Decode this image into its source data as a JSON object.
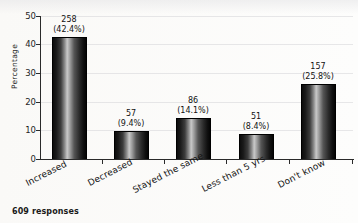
{
  "chart_data": {
    "type": "bar",
    "title": "",
    "title_note": "title cropped off at top edge, illegible",
    "xlabel": "",
    "ylabel": "Percentage",
    "ylim": [
      0,
      50
    ],
    "yticks": [
      0,
      10,
      20,
      30,
      40,
      50
    ],
    "grid": true,
    "legend": "none",
    "categories": [
      "Increased",
      "Decreased",
      "Stayed the same",
      "Less than 5 yrs",
      "Don't know"
    ],
    "values": [
      42.4,
      9.4,
      14.1,
      8.4,
      25.8
    ],
    "counts": [
      258,
      57,
      86,
      51,
      157
    ],
    "data_labels": [
      {
        "count": "258",
        "pct": "(42.4%)"
      },
      {
        "count": "57",
        "pct": "(9.4%)"
      },
      {
        "count": "86",
        "pct": "(14.1%)"
      },
      {
        "count": "51",
        "pct": "(8.4%)"
      },
      {
        "count": "157",
        "pct": "(25.8%)"
      }
    ],
    "footnote": "609 responses"
  },
  "axis": {
    "y_title": "Percentage",
    "tick_labels": [
      "50",
      "40",
      "30",
      "20",
      "10",
      "0"
    ]
  },
  "footer": {
    "responses": "609 responses"
  }
}
